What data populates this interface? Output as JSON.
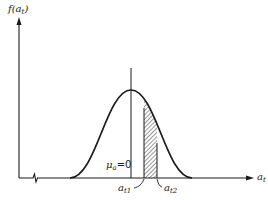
{
  "diagram": {
    "type": "normal-distribution-probability-area",
    "y_axis_label": {
      "main": "f(a",
      "sub": "t",
      "close": ")"
    },
    "x_axis_label": {
      "main": "a",
      "sub": "t"
    },
    "mean_label": {
      "main": "μ",
      "sub": "a",
      "rest": "=0"
    },
    "interval_lower_label": {
      "main": "a",
      "sub": "t1"
    },
    "interval_upper_label": {
      "main": "a",
      "sub": "t2"
    },
    "shaded_region": "area under curve between a_t1 and a_t2",
    "colors": {
      "ink": "#1a1a1a",
      "background": "#ffffff"
    }
  }
}
